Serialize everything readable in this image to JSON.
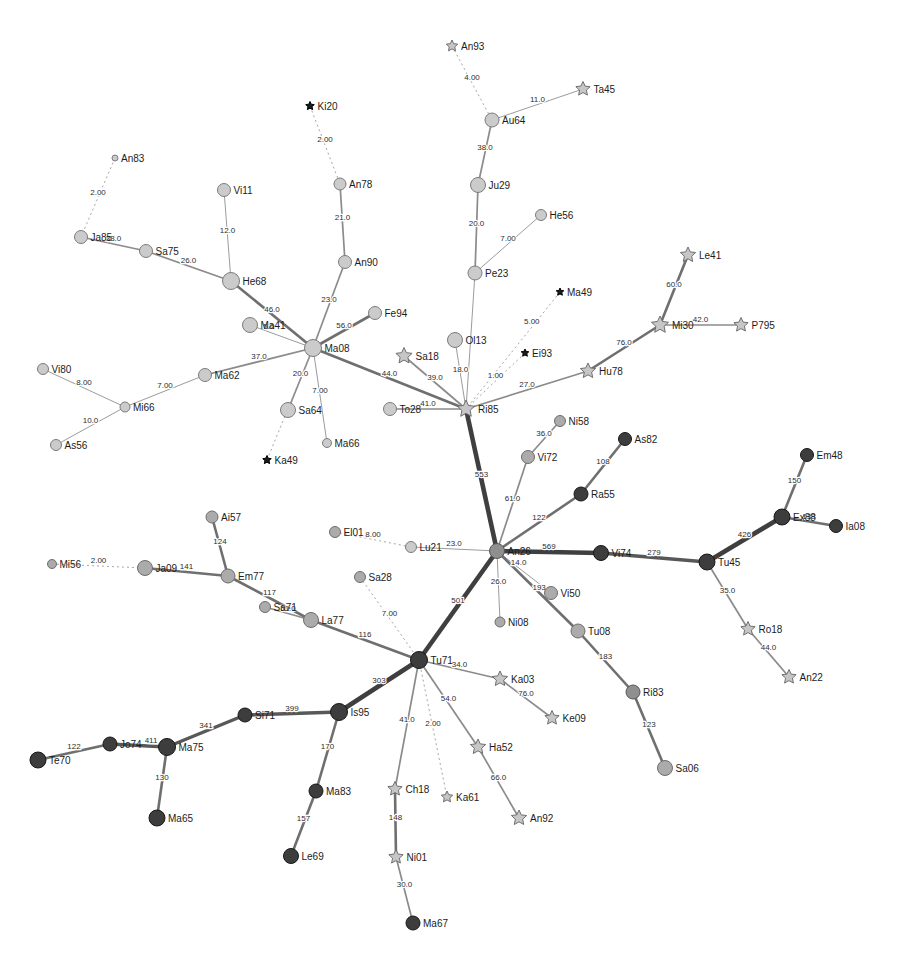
{
  "graph": {
    "description": "Minimum spanning network of labeled nodes with weighted edges",
    "nodes": [
      {
        "id": "An93",
        "x": 452,
        "y": 46,
        "shape": "star",
        "sz": 6,
        "fill": "S"
      },
      {
        "id": "Ta45",
        "x": 583,
        "y": 89,
        "shape": "star",
        "sz": 7.5,
        "fill": "S"
      },
      {
        "id": "Au64",
        "x": 492,
        "y": 120,
        "shape": "circle",
        "sz": 7,
        "fill": "L"
      },
      {
        "id": "Ki20",
        "x": 310,
        "y": 106,
        "shape": "bstar",
        "sz": 4.5,
        "fill": "B"
      },
      {
        "id": "An83",
        "x": 115,
        "y": 158,
        "shape": "circle",
        "sz": 3,
        "fill": "L"
      },
      {
        "id": "Vi11",
        "x": 224,
        "y": 190,
        "shape": "circle",
        "sz": 6.5,
        "fill": "L"
      },
      {
        "id": "An78",
        "x": 340,
        "y": 184,
        "shape": "circle",
        "sz": 6,
        "fill": "L"
      },
      {
        "id": "Ju29",
        "x": 478,
        "y": 185,
        "shape": "circle",
        "sz": 7.5,
        "fill": "L"
      },
      {
        "id": "He56",
        "x": 541,
        "y": 215,
        "shape": "circle",
        "sz": 5.5,
        "fill": "L"
      },
      {
        "id": "Ja85",
        "x": 81,
        "y": 237,
        "shape": "circle",
        "sz": 6.5,
        "fill": "L"
      },
      {
        "id": "Sa75",
        "x": 146,
        "y": 251,
        "shape": "circle",
        "sz": 6.5,
        "fill": "L"
      },
      {
        "id": "An90",
        "x": 345,
        "y": 262,
        "shape": "circle",
        "sz": 6.5,
        "fill": "L"
      },
      {
        "id": "Le41",
        "x": 688,
        "y": 255,
        "shape": "star",
        "sz": 8,
        "fill": "S"
      },
      {
        "id": "He68",
        "x": 231,
        "y": 281,
        "shape": "circle",
        "sz": 8.5,
        "fill": "L"
      },
      {
        "id": "Pe23",
        "x": 475,
        "y": 273,
        "shape": "circle",
        "sz": 7,
        "fill": "L"
      },
      {
        "id": "Ma49",
        "x": 560,
        "y": 292,
        "shape": "bstar",
        "sz": 4,
        "fill": "B"
      },
      {
        "id": "Fe94",
        "x": 375,
        "y": 313,
        "shape": "circle",
        "sz": 6.5,
        "fill": "L"
      },
      {
        "id": "Mi30",
        "x": 660,
        "y": 325,
        "shape": "star",
        "sz": 9,
        "fill": "S"
      },
      {
        "id": "P795",
        "x": 741,
        "y": 325,
        "shape": "star",
        "sz": 7.5,
        "fill": "S"
      },
      {
        "id": "Ma41",
        "x": 250,
        "y": 325,
        "shape": "circle",
        "sz": 7.5,
        "fill": "L"
      },
      {
        "id": "Ma08",
        "x": 313,
        "y": 348,
        "shape": "circle",
        "sz": 8.5,
        "fill": "L"
      },
      {
        "id": "Ol13",
        "x": 455,
        "y": 340,
        "shape": "circle",
        "sz": 7.5,
        "fill": "L"
      },
      {
        "id": "Ei93",
        "x": 525,
        "y": 353,
        "shape": "bstar",
        "sz": 4,
        "fill": "B"
      },
      {
        "id": "Sa18",
        "x": 404,
        "y": 356,
        "shape": "star",
        "sz": 8.5,
        "fill": "S"
      },
      {
        "id": "Vi80",
        "x": 43,
        "y": 369,
        "shape": "circle",
        "sz": 5.5,
        "fill": "L"
      },
      {
        "id": "Ma62",
        "x": 205,
        "y": 375,
        "shape": "circle",
        "sz": 6.5,
        "fill": "L"
      },
      {
        "id": "Hu78",
        "x": 588,
        "y": 371,
        "shape": "star",
        "sz": 8,
        "fill": "S"
      },
      {
        "id": "Mi66",
        "x": 125,
        "y": 407,
        "shape": "circle",
        "sz": 5,
        "fill": "L"
      },
      {
        "id": "To28",
        "x": 390,
        "y": 409,
        "shape": "circle",
        "sz": 6.5,
        "fill": "L"
      },
      {
        "id": "Ri85",
        "x": 466,
        "y": 409,
        "shape": "star",
        "sz": 9,
        "fill": "S"
      },
      {
        "id": "Sa64",
        "x": 288,
        "y": 410,
        "shape": "circle",
        "sz": 7.5,
        "fill": "L"
      },
      {
        "id": "Ni58",
        "x": 560,
        "y": 421,
        "shape": "circle",
        "sz": 5.5,
        "fill": "M"
      },
      {
        "id": "As56",
        "x": 56,
        "y": 445,
        "shape": "circle",
        "sz": 5.5,
        "fill": "L"
      },
      {
        "id": "Ma66",
        "x": 327,
        "y": 443,
        "shape": "circle",
        "sz": 4.5,
        "fill": "L"
      },
      {
        "id": "As82",
        "x": 625,
        "y": 439,
        "shape": "circle",
        "sz": 6.5,
        "fill": "D"
      },
      {
        "id": "Vi72",
        "x": 528,
        "y": 457,
        "shape": "circle",
        "sz": 6.5,
        "fill": "M"
      },
      {
        "id": "Em48",
        "x": 807,
        "y": 455,
        "shape": "circle",
        "sz": 6.5,
        "fill": "D"
      },
      {
        "id": "Ka49",
        "x": 267,
        "y": 460,
        "shape": "bstar",
        "sz": 4.5,
        "fill": "B"
      },
      {
        "id": "Ra55",
        "x": 581,
        "y": 494,
        "shape": "circle",
        "sz": 7,
        "fill": "D"
      },
      {
        "id": "Ai57",
        "x": 212,
        "y": 517,
        "shape": "circle",
        "sz": 6,
        "fill": "M"
      },
      {
        "id": "Ex88",
        "x": 782,
        "y": 517,
        "shape": "circle",
        "sz": 8,
        "fill": "D"
      },
      {
        "id": "Ia08",
        "x": 836,
        "y": 526,
        "shape": "circle",
        "sz": 6.5,
        "fill": "D"
      },
      {
        "id": "El01",
        "x": 335,
        "y": 532,
        "shape": "circle",
        "sz": 5.5,
        "fill": "M"
      },
      {
        "id": "Lu21",
        "x": 411,
        "y": 547,
        "shape": "circle",
        "sz": 5.5,
        "fill": "L"
      },
      {
        "id": "An26",
        "x": 497,
        "y": 551,
        "shape": "circle",
        "sz": 7.5,
        "fill": "G"
      },
      {
        "id": "Vi74",
        "x": 601,
        "y": 553,
        "shape": "circle",
        "sz": 7.5,
        "fill": "D"
      },
      {
        "id": "Tu45",
        "x": 707,
        "y": 562,
        "shape": "circle",
        "sz": 8,
        "fill": "D"
      },
      {
        "id": "Mi56",
        "x": 52,
        "y": 564,
        "shape": "circle",
        "sz": 4.5,
        "fill": "M"
      },
      {
        "id": "Ja09",
        "x": 145,
        "y": 568,
        "shape": "circle",
        "sz": 7.5,
        "fill": "M"
      },
      {
        "id": "Sa28",
        "x": 360,
        "y": 577,
        "shape": "circle",
        "sz": 5.5,
        "fill": "M"
      },
      {
        "id": "Em77",
        "x": 228,
        "y": 576,
        "shape": "circle",
        "sz": 7,
        "fill": "M"
      },
      {
        "id": "Vi50",
        "x": 551,
        "y": 593,
        "shape": "circle",
        "sz": 6.5,
        "fill": "M"
      },
      {
        "id": "Sa71",
        "x": 265,
        "y": 607,
        "shape": "circle",
        "sz": 5.5,
        "fill": "M"
      },
      {
        "id": "La77",
        "x": 311,
        "y": 620,
        "shape": "circle",
        "sz": 7.5,
        "fill": "M"
      },
      {
        "id": "Ni08",
        "x": 500,
        "y": 622,
        "shape": "circle",
        "sz": 5,
        "fill": "M"
      },
      {
        "id": "Tu08",
        "x": 578,
        "y": 631,
        "shape": "circle",
        "sz": 7,
        "fill": "M"
      },
      {
        "id": "Ro18",
        "x": 748,
        "y": 629,
        "shape": "star",
        "sz": 7.5,
        "fill": "S"
      },
      {
        "id": "Tu71",
        "x": 419,
        "y": 660,
        "shape": "circle",
        "sz": 8.5,
        "fill": "D"
      },
      {
        "id": "An22",
        "x": 789,
        "y": 677,
        "shape": "star",
        "sz": 7.5,
        "fill": "S"
      },
      {
        "id": "Ka03",
        "x": 500,
        "y": 679,
        "shape": "star",
        "sz": 8,
        "fill": "S"
      },
      {
        "id": "Ri83",
        "x": 633,
        "y": 692,
        "shape": "circle",
        "sz": 7,
        "fill": "G"
      },
      {
        "id": "Is95",
        "x": 339,
        "y": 712,
        "shape": "circle",
        "sz": 8.5,
        "fill": "D"
      },
      {
        "id": "Si71",
        "x": 245,
        "y": 715,
        "shape": "circle",
        "sz": 7,
        "fill": "D"
      },
      {
        "id": "Ke09",
        "x": 552,
        "y": 718,
        "shape": "star",
        "sz": 7.5,
        "fill": "S"
      },
      {
        "id": "Jo74",
        "x": 110,
        "y": 744,
        "shape": "circle",
        "sz": 7,
        "fill": "D"
      },
      {
        "id": "Ma75",
        "x": 167,
        "y": 747,
        "shape": "circle",
        "sz": 8.5,
        "fill": "D"
      },
      {
        "id": "Ha52",
        "x": 478,
        "y": 747,
        "shape": "star",
        "sz": 8,
        "fill": "S"
      },
      {
        "id": "Te70",
        "x": 38,
        "y": 760,
        "shape": "circle",
        "sz": 8,
        "fill": "D"
      },
      {
        "id": "Sa06",
        "x": 665,
        "y": 768,
        "shape": "circle",
        "sz": 7.5,
        "fill": "M"
      },
      {
        "id": "Ma83",
        "x": 316,
        "y": 791,
        "shape": "circle",
        "sz": 7,
        "fill": "D"
      },
      {
        "id": "Ka61",
        "x": 447,
        "y": 797,
        "shape": "star",
        "sz": 6,
        "fill": "S"
      },
      {
        "id": "Ch18",
        "x": 395,
        "y": 789,
        "shape": "star",
        "sz": 7.5,
        "fill": "S"
      },
      {
        "id": "Ma65",
        "x": 157,
        "y": 818,
        "shape": "circle",
        "sz": 8,
        "fill": "D"
      },
      {
        "id": "An92",
        "x": 519,
        "y": 818,
        "shape": "star",
        "sz": 8,
        "fill": "S"
      },
      {
        "id": "Le69",
        "x": 291,
        "y": 856,
        "shape": "circle",
        "sz": 7.5,
        "fill": "D"
      },
      {
        "id": "Ni01",
        "x": 396,
        "y": 857,
        "shape": "star",
        "sz": 7.5,
        "fill": "S"
      },
      {
        "id": "Ma67",
        "x": 413,
        "y": 923,
        "shape": "circle",
        "sz": 7,
        "fill": "D"
      }
    ],
    "edges": [
      [
        "An93",
        "Au64",
        "4.00",
        "d"
      ],
      [
        "Ta45",
        "Au64",
        "11.0",
        "1"
      ],
      [
        "Au64",
        "Ju29",
        "38.0",
        "2"
      ],
      [
        "Ju29",
        "Pe23",
        "20.0",
        "2"
      ],
      [
        "He56",
        "Pe23",
        "7.00",
        "1"
      ],
      [
        "Pe23",
        "Ri85",
        "",
        "1"
      ],
      [
        "Ki20",
        "An78",
        "2.00",
        "d"
      ],
      [
        "An78",
        "An90",
        "21.0",
        "2"
      ],
      [
        "An90",
        "Ma08",
        "23.0",
        "2"
      ],
      [
        "An83",
        "Ja85",
        "2.00",
        "d"
      ],
      [
        "Ja85",
        "Sa75",
        "33.0",
        "2"
      ],
      [
        "Sa75",
        "He68",
        "26.0",
        "2"
      ],
      [
        "Vi11",
        "He68",
        "12.0",
        "1"
      ],
      [
        "He68",
        "Ma08",
        "46.0",
        "3"
      ],
      [
        "Fe94",
        "Ma08",
        "56.0",
        "3"
      ],
      [
        "Ma41",
        "Ma08",
        "5.0",
        "1",
        0.3
      ],
      [
        "Ma62",
        "Ma08",
        "37.0",
        "2"
      ],
      [
        "Ma62",
        "Mi66",
        "7.00",
        "1"
      ],
      [
        "Vi80",
        "Mi66",
        "8.00",
        "1"
      ],
      [
        "Mi66",
        "As56",
        "10.0",
        "1"
      ],
      [
        "Sa64",
        "Ma08",
        "20.0",
        "2"
      ],
      [
        "Ma66",
        "Ma08",
        "7.00",
        "1"
      ],
      [
        "Ka49",
        "Ma08",
        "",
        "d"
      ],
      [
        "Ma08",
        "Ri85",
        "44.0",
        "3"
      ],
      [
        "Sa18",
        "Ri85",
        "39.0",
        "2"
      ],
      [
        "To28",
        "Ri85",
        "41.0",
        "2"
      ],
      [
        "Ol13",
        "Ri85",
        "18.0",
        "1"
      ],
      [
        "Ei93",
        "Ri85",
        "1.00",
        "d"
      ],
      [
        "Ma49",
        "Ri85",
        "5.00",
        "d",
        0.3
      ],
      [
        "Hu78",
        "Ri85",
        "27.0",
        "2"
      ],
      [
        "Mi30",
        "Hu78",
        "76.0",
        "3"
      ],
      [
        "Le41",
        "Mi30",
        "60.0",
        "3"
      ],
      [
        "Mi30",
        "P795",
        "42.0",
        "2"
      ],
      [
        "Ri85",
        "An26",
        "553",
        "5"
      ],
      [
        "Ni58",
        "Vi72",
        "36.0",
        "2"
      ],
      [
        "Vi72",
        "An26",
        "61.0",
        "2"
      ],
      [
        "Ra55",
        "An26",
        "122",
        "3"
      ],
      [
        "As82",
        "Ra55",
        "108",
        "3"
      ],
      [
        "An26",
        "Vi74",
        "569",
        "5"
      ],
      [
        "Vi74",
        "Tu45",
        "279",
        "4"
      ],
      [
        "Tu45",
        "Ex88",
        "426",
        "5"
      ],
      [
        "Ex88",
        "Em48",
        "150",
        "3"
      ],
      [
        "Ex88",
        "Ia08",
        "133",
        "3"
      ],
      [
        "Tu45",
        "Ro18",
        "35.0",
        "2"
      ],
      [
        "Ro18",
        "An22",
        "44.0",
        "2"
      ],
      [
        "Lu21",
        "An26",
        "23.0",
        "1"
      ],
      [
        "El01",
        "Lu21",
        "8.00",
        "d"
      ],
      [
        "An26",
        "Ni08",
        "26.0",
        "1"
      ],
      [
        "An26",
        "Vi50",
        "14.0",
        "1",
        0.4
      ],
      [
        "An26",
        "Tu08",
        "193",
        "3",
        0.52
      ],
      [
        "Tu08",
        "Ri83",
        "183",
        "3"
      ],
      [
        "Ri83",
        "Sa06",
        "123",
        "3"
      ],
      [
        "An26",
        "Tu71",
        "501",
        "5"
      ],
      [
        "La77",
        "Tu71",
        "116",
        "3"
      ],
      [
        "Em77",
        "La77",
        "117",
        "3"
      ],
      [
        "Sa71",
        "La77",
        "51.0",
        "2"
      ],
      [
        "Ja09",
        "Em77",
        "141",
        "3"
      ],
      [
        "Ai57",
        "Em77",
        "124",
        "3"
      ],
      [
        "Mi56",
        "Ja09",
        "2.00",
        "d"
      ],
      [
        "Sa28",
        "Tu71",
        "7.00",
        "d"
      ],
      [
        "Tu71",
        "Ka03",
        "34.0",
        "2"
      ],
      [
        "Ka03",
        "Ke09",
        "76.0",
        "2"
      ],
      [
        "Tu71",
        "Ha52",
        "54.0",
        "2"
      ],
      [
        "Ha52",
        "An92",
        "66.0",
        "2"
      ],
      [
        "Tu71",
        "Ch18",
        "41.0",
        "2"
      ],
      [
        "Ch18",
        "Ni01",
        "148",
        "3"
      ],
      [
        "Ni01",
        "Ma67",
        "30.0",
        "2"
      ],
      [
        "Tu71",
        "Ka61",
        "2.00",
        "d"
      ],
      [
        "Tu71",
        "Is95",
        "303",
        "5"
      ],
      [
        "Is95",
        "Ma83",
        "170",
        "3"
      ],
      [
        "Ma83",
        "Le69",
        "157",
        "3"
      ],
      [
        "Is95",
        "Si71",
        "399",
        "4"
      ],
      [
        "Si71",
        "Ma75",
        "341",
        "4"
      ],
      [
        "Ma75",
        "Jo74",
        "411",
        "4",
        0.28
      ],
      [
        "Jo74",
        "Te70",
        "122",
        "3"
      ],
      [
        "Ma75",
        "Ma65",
        "130",
        "3"
      ]
    ],
    "colors": {
      "node_light": "#cbcbcb",
      "node_medium": "#ababab",
      "node_gray": "#8f8f8f",
      "node_dark": "#3d3d3d",
      "star_light": "#c6c6c6",
      "star_black": "#1c1c1c",
      "edge_thin": "#9b9b9b",
      "edge_thick": "#3f3f3f",
      "label": "#1c1c1c"
    }
  }
}
